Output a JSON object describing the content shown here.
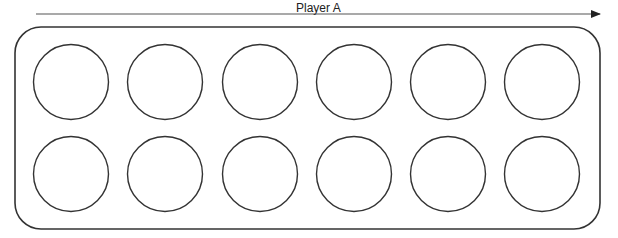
{
  "diagram": {
    "direction_label": "Player A",
    "arrow": {
      "x1": 36,
      "x2": 600,
      "y": 14
    },
    "board": {
      "x": 15,
      "y": 27,
      "width": 585,
      "height": 202,
      "radius": 26
    },
    "rows": 2,
    "pits_per_row": 6,
    "pit_centers_x": [
      71,
      165,
      260,
      354,
      448,
      542
    ],
    "pit_centers_y": [
      82,
      174
    ],
    "pit_radius": 37.5,
    "stroke_color": "#333333",
    "arrow_color": "#555555"
  }
}
